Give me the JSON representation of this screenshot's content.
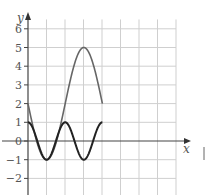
{
  "chart_data": {
    "type": "line",
    "title": "",
    "xlabel": "x",
    "ylabel": "y",
    "x_unit": "pi/2 per grid cell",
    "xlim": [
      0,
      6.2832
    ],
    "ylim": [
      -2.5,
      6.5
    ],
    "y_ticks": [
      6,
      5,
      4,
      3,
      2,
      1,
      0,
      -1,
      -2
    ],
    "y_tick_labels": [
      "6",
      "5",
      "4",
      "3",
      "2",
      "1",
      "0",
      "−1",
      "−2"
    ],
    "grid": true,
    "series": [
      {
        "name": "y = 2 - 3 sin x",
        "color": "#666666",
        "x": [
          0,
          1.5708,
          3.1416,
          4.7124,
          6.2832
        ],
        "y": [
          2,
          -1,
          2,
          5,
          2
        ]
      },
      {
        "name": "y = cos 2x",
        "color": "#222222",
        "x": [
          0,
          1.5708,
          3.1416,
          4.7124,
          6.2832
        ],
        "y": [
          1,
          -1,
          1,
          -1,
          1
        ]
      }
    ]
  },
  "labels": {
    "x_axis": "x",
    "y_axis": "y"
  }
}
